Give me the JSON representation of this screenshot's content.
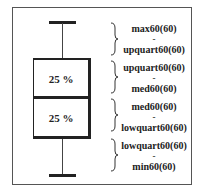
{
  "diagram": {
    "type": "box-plot-legend",
    "boxes": [
      {
        "id": "upper",
        "label": "25 %"
      },
      {
        "id": "lower",
        "label": "25 %"
      }
    ],
    "ranges": [
      {
        "from": "max60(60)",
        "sep": "-",
        "to": "upquart60(60)"
      },
      {
        "from": "upquart60(60)",
        "sep": "-",
        "to": "med60(60)"
      },
      {
        "from": "med60(60)",
        "sep": "-",
        "to": "lowquart60(60)"
      },
      {
        "from": "lowquart60(60)",
        "sep": "-",
        "to": "min60(60)"
      }
    ],
    "colors": {
      "line": "#222222",
      "background": "#ffffff"
    }
  }
}
